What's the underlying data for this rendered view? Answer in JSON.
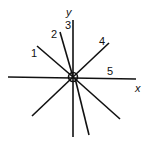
{
  "diagram": {
    "axes": {
      "x_label": "x",
      "y_label": "y"
    },
    "line_labels": [
      "1",
      "2",
      "3",
      "4",
      "5"
    ],
    "center": {
      "x": 73,
      "y": 77
    },
    "lines": [
      {
        "x1": 37,
        "y1": 46,
        "x2": 73,
        "y2": 77
      },
      {
        "x1": 60,
        "y1": 32,
        "x2": 73,
        "y2": 77
      },
      {
        "x1": 73,
        "y1": 20,
        "x2": 73,
        "y2": 137
      },
      {
        "x1": 109,
        "y1": 43,
        "x2": 73,
        "y2": 77
      },
      {
        "x1": 8,
        "y1": 77,
        "x2": 136,
        "y2": 79
      },
      {
        "x1": 73,
        "y1": 77,
        "x2": 32,
        "y2": 116
      },
      {
        "x1": 75,
        "y1": 78,
        "x2": 89,
        "y2": 135
      },
      {
        "x1": 73,
        "y1": 77,
        "x2": 120,
        "y2": 119
      }
    ]
  }
}
